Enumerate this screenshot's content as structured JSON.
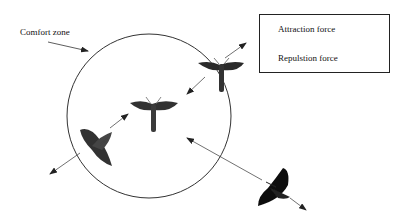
{
  "diagram": {
    "comfort_zone_label": "Comfort zone",
    "legend": {
      "items": [
        {
          "label": "Attraction force",
          "arrow": "arrow-right"
        },
        {
          "label": "Repulsion force",
          "arrow": "arrow-right"
        }
      ],
      "items_display": [
        "Attraction force",
        "Repulstion force"
      ]
    },
    "elements": {
      "circle": "comfort-zone-circle",
      "moths": [
        {
          "name": "moth-upper-right",
          "position": "inside, near upper-right edge",
          "forces": [
            "repulsion outward up-right",
            "attraction inward down-left"
          ]
        },
        {
          "name": "moth-center",
          "position": "inside, center",
          "forces": []
        },
        {
          "name": "moth-lower-left",
          "position": "inside, near lower-left edge",
          "forces": [
            "repulsion outward down-left",
            "attraction toward center"
          ]
        },
        {
          "name": "moth-outside",
          "position": "outside, lower-right",
          "forces": [
            "attraction toward center",
            "outward arrow down-right"
          ]
        }
      ]
    },
    "colors": {
      "line": "#333333",
      "moth_dark": "#1a1a1a",
      "moth_mid": "#4a4a4a"
    }
  }
}
